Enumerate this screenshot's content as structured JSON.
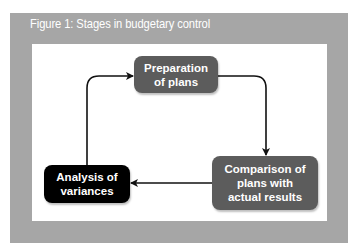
{
  "figure": {
    "title": "Figure 1: Stages in budgetary control",
    "colors": {
      "frame": "#a6a6a6",
      "canvas": "#ffffff",
      "box_grey": "#5c5c5c",
      "box_black": "#000000",
      "box_text": "#ffffff",
      "arrow": "#111111"
    },
    "nodes": [
      {
        "id": "preparation",
        "line1": "Preparation",
        "line2": "of plans",
        "style": "grey"
      },
      {
        "id": "comparison",
        "line1": "Comparison of",
        "line2": "plans with",
        "line3": "actual results",
        "style": "grey"
      },
      {
        "id": "analysis",
        "line1": "Analysis of",
        "line2": "variances",
        "style": "black"
      }
    ],
    "edges": [
      {
        "from": "preparation",
        "to": "comparison"
      },
      {
        "from": "comparison",
        "to": "analysis"
      },
      {
        "from": "analysis",
        "to": "preparation"
      }
    ]
  }
}
